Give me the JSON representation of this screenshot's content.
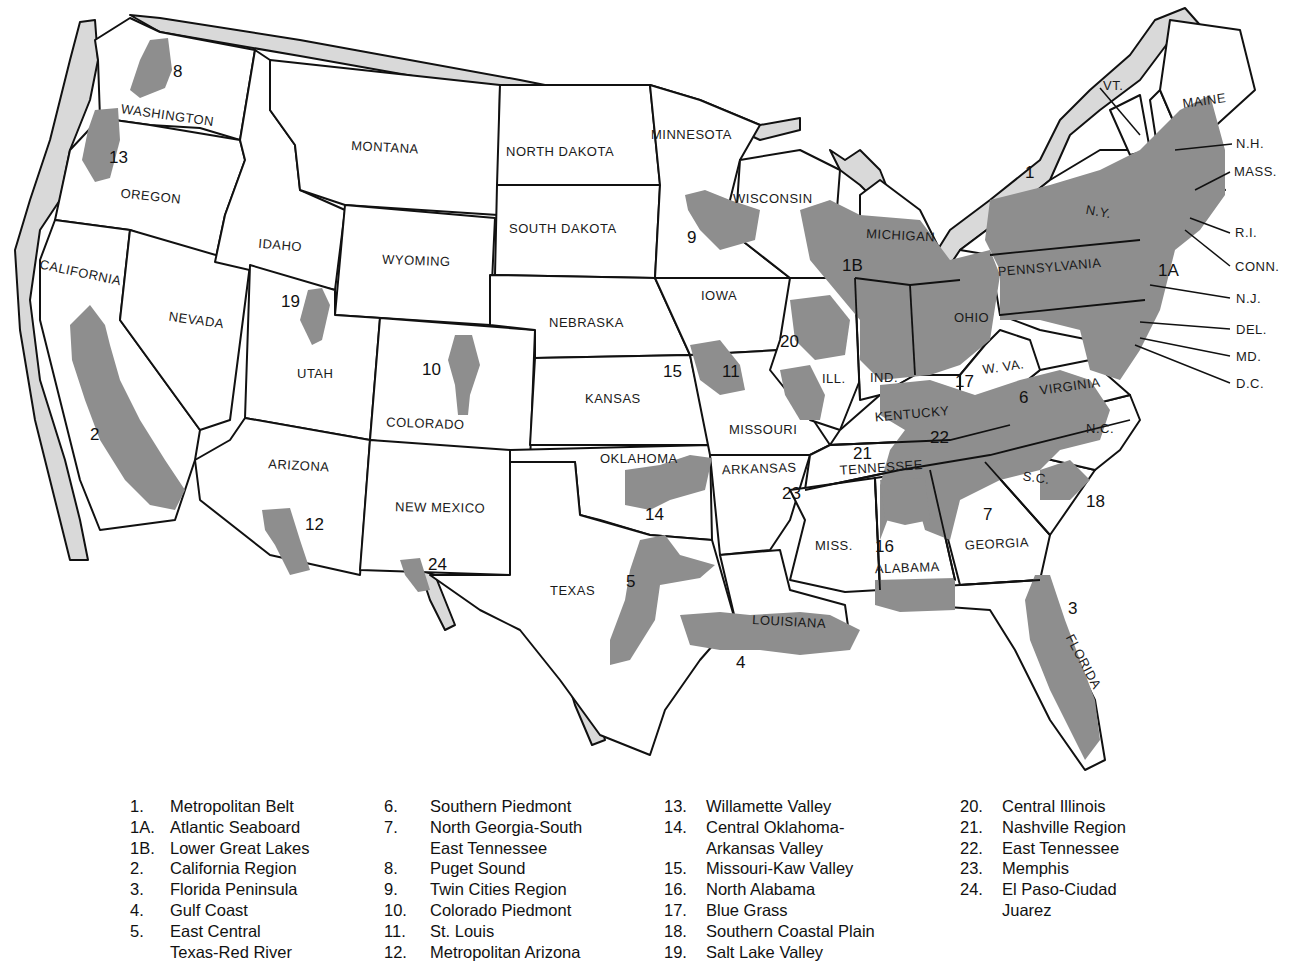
{
  "colors": {
    "background": "#ffffff",
    "state_fill": "#ffffff",
    "border": "#111111",
    "urban_region": "#8e8e8e",
    "border_band": "#d9d9d9"
  },
  "states": {
    "washington": "WASHINGTON",
    "oregon": "OREGON",
    "california": "CALIFORNIA",
    "nevada": "NEVADA",
    "idaho": "IDAHO",
    "montana": "MONTANA",
    "wyoming": "WYOMING",
    "utah": "UTAH",
    "colorado": "COLORADO",
    "arizona": "ARIZONA",
    "new_mexico": "NEW MEXICO",
    "north_dakota": "NORTH DAKOTA",
    "south_dakota": "SOUTH DAKOTA",
    "nebraska": "NEBRASKA",
    "kansas": "KANSAS",
    "oklahoma": "OKLAHOMA",
    "texas": "TEXAS",
    "minnesota": "MINNESOTA",
    "iowa": "IOWA",
    "missouri": "MISSOURI",
    "arkansas": "ARKANSAS",
    "louisiana": "LOUISIANA",
    "wisconsin": "WISCONSIN",
    "michigan": "MICHIGAN",
    "illinois": "ILL.",
    "indiana": "IND.",
    "ohio": "OHIO",
    "kentucky": "KENTUCKY",
    "tennessee": "TENNESSEE",
    "mississippi": "MISS.",
    "alabama": "ALABAMA",
    "georgia": "GEORGIA",
    "florida": "FLORIDA",
    "south_carolina": "S.C.",
    "north_carolina": "N.C.",
    "virginia": "VIRGINIA",
    "west_virginia": "W. VA.",
    "pennsylvania": "PENNSYLVANIA",
    "new_york": "N.Y.",
    "vermont": "VT.",
    "maine": "MAINE",
    "new_hampshire": "N.H.",
    "massachusetts": "MASS.",
    "rhode_island": "R.I.",
    "connecticut": "CONN.",
    "new_jersey": "N.J.",
    "delaware": "DEL.",
    "maryland": "MD.",
    "dc": "D.C."
  },
  "region_markers": {
    "r1": "1",
    "r1a": "1A",
    "r1b": "1B",
    "r2": "2",
    "r3": "3",
    "r4": "4",
    "r5": "5",
    "r6": "6",
    "r7": "7",
    "r8": "8",
    "r9": "9",
    "r10": "10",
    "r11": "11",
    "r12": "12",
    "r13": "13",
    "r14": "14",
    "r15": "15",
    "r16": "16",
    "r17": "17",
    "r18": "18",
    "r19": "19",
    "r20": "20",
    "r21": "21",
    "r22": "22",
    "r23": "23",
    "r24": "24"
  },
  "legend": {
    "columns": [
      [
        {
          "key": "1.",
          "lines": [
            "Metropolitan Belt"
          ]
        },
        {
          "key": "1A.",
          "lines": [
            "Atlantic Seaboard"
          ]
        },
        {
          "key": "1B.",
          "lines": [
            "Lower Great Lakes"
          ]
        },
        {
          "key": "2.",
          "lines": [
            "California Region"
          ]
        },
        {
          "key": "3.",
          "lines": [
            "Florida Peninsula"
          ]
        },
        {
          "key": "4.",
          "lines": [
            "Gulf Coast"
          ]
        },
        {
          "key": "5.",
          "lines": [
            "East Central",
            "Texas-Red River"
          ]
        }
      ],
      [
        {
          "key": "6.",
          "lines": [
            "Southern Piedmont"
          ]
        },
        {
          "key": "7.",
          "lines": [
            "North Georgia-South",
            "East Tennessee"
          ]
        },
        {
          "key": "8.",
          "lines": [
            "Puget Sound"
          ]
        },
        {
          "key": "9.",
          "lines": [
            "Twin Cities Region"
          ]
        },
        {
          "key": "10.",
          "lines": [
            "Colorado Piedmont"
          ]
        },
        {
          "key": "11.",
          "lines": [
            "St. Louis"
          ]
        },
        {
          "key": "12.",
          "lines": [
            "Metropolitan Arizona"
          ]
        }
      ],
      [
        {
          "key": "13.",
          "lines": [
            "Willamette Valley"
          ]
        },
        {
          "key": "14.",
          "lines": [
            "Central Oklahoma-",
            "Arkansas Valley"
          ]
        },
        {
          "key": "15.",
          "lines": [
            "Missouri-Kaw Valley"
          ]
        },
        {
          "key": "16.",
          "lines": [
            "North Alabama"
          ]
        },
        {
          "key": "17.",
          "lines": [
            "Blue Grass"
          ]
        },
        {
          "key": "18.",
          "lines": [
            "Southern Coastal Plain"
          ]
        },
        {
          "key": "19.",
          "lines": [
            "Salt Lake Valley"
          ]
        }
      ],
      [
        {
          "key": "20.",
          "lines": [
            "Central Illinois"
          ]
        },
        {
          "key": "21.",
          "lines": [
            "Nashville Region"
          ]
        },
        {
          "key": "22.",
          "lines": [
            "East Tennessee"
          ]
        },
        {
          "key": "23.",
          "lines": [
            "Memphis"
          ]
        },
        {
          "key": "24.",
          "lines": [
            "El Paso-Ciudad",
            "Juarez"
          ]
        }
      ]
    ]
  }
}
